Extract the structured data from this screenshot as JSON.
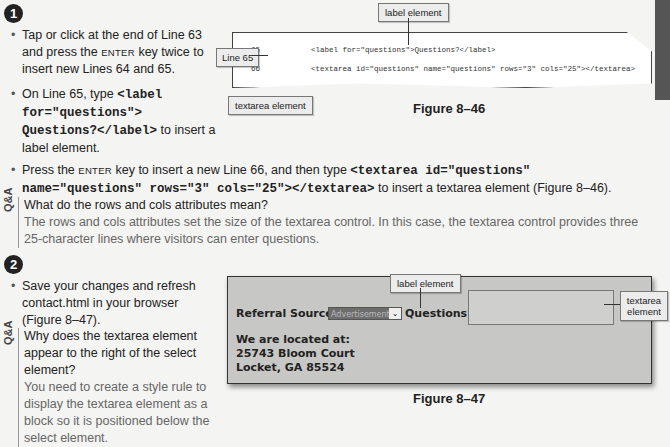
{
  "step1": {
    "number": "1",
    "bullets": [
      {
        "pre": "Tap or click at the end of Line 63 and press the ",
        "key": "ENTER",
        "post": " key twice to insert new Lines 64 and 65."
      },
      {
        "pre": "On Line 65, type ",
        "code": "<label for=\"questions\"> Questions?</label>",
        "post": " to insert a label element."
      },
      {
        "pre": "Press the ",
        "key": "ENTER",
        "mid": " key to insert a new Line 66, and then type ",
        "code": "<textarea id=\"questions\" name=\"questions\" rows=\"3\" cols=\"25\"></textarea>",
        "post": " to insert a textarea element (Figure 8–46)."
      }
    ],
    "qa": {
      "tag": "Q&A",
      "question": "What do the rows and cols attributes mean?",
      "answer": "The rows and cols attributes set the size of the textarea control. In this case, the textarea control provides three 25-character lines where visitors can enter questions."
    }
  },
  "figure46": {
    "caption": "Figure 8–46",
    "callouts": {
      "label": "label element",
      "line": "Line 65",
      "textarea": "textarea element"
    },
    "lines": [
      {
        "num": "65",
        "code": "<label for=\"questions\">Questions?</label>"
      },
      {
        "num": "66",
        "code": "<textarea id=\"questions\" name=\"questions\" rows=\"3\" cols=\"25\"></textarea>"
      }
    ]
  },
  "step2": {
    "number": "2",
    "bullet": "Save your changes and refresh contact.html in your browser (Figure 8–47).",
    "qa": {
      "tag": "Q&A",
      "question": "Why does the textarea element appear to the right of the select element?",
      "answer": "You need to create a style rule to display the textarea element as a block so it is positioned below the select element."
    }
  },
  "figure47": {
    "caption": "Figure 8–47",
    "callouts": {
      "label": "label element",
      "textarea": "textarea element"
    },
    "referral_label": "Referral Source:",
    "select_value": "Advertisement",
    "questions_label": "Questions?",
    "address": [
      "We are located at:",
      "25743 Bloom Court",
      "Locket, GA 85524"
    ]
  }
}
